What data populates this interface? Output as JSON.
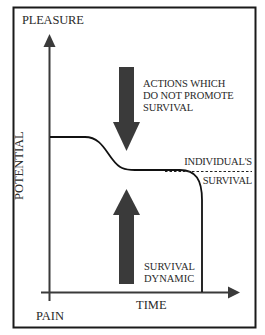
{
  "diagram": {
    "y_axis": {
      "top_label": "PLEASURE",
      "bottom_label": "PAIN",
      "axis_title": "POTENTIAL"
    },
    "x_axis": {
      "axis_title": "TIME"
    },
    "annotations": {
      "down_arrow_label": "ACTIONS WHICH\nDO NOT PROMOTE\nSURVIVAL",
      "up_arrow_label": "SURVIVAL\nDYNAMIC",
      "threshold_label_top": "INDIVIDUAL'S",
      "threshold_label_bottom": "SURVIVAL"
    },
    "colors": {
      "frame": "#1a1a1a",
      "axis": "#333333",
      "arrow_fill": "#3a3a3a",
      "curve": "#111111",
      "background": "#ffffff"
    }
  }
}
